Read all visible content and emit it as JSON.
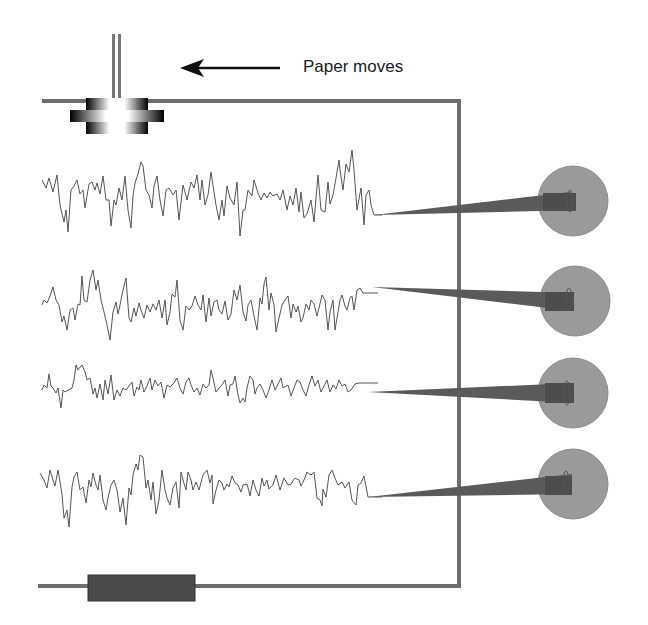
{
  "diagram": {
    "type": "polygraph / chart recorder schematic",
    "label_paper_moves": "Paper moves",
    "arrow_direction": "left",
    "colors": {
      "frame": "#6d6d6d",
      "trace": "#555555",
      "pen_arm": "#5a5a5a",
      "pen_hub": "#9a9a9a",
      "bottom_bar": "#4a4a4a",
      "text": "#1a1a1a"
    },
    "components": [
      {
        "id": "roller",
        "name": "paper feed roller (top-left)"
      },
      {
        "id": "paper-frame",
        "name": "paper path / frame"
      },
      {
        "id": "bottom-bar",
        "name": "paper supply roll (bottom-left)"
      },
      {
        "id": "pen-1",
        "name": "recording pen 1"
      },
      {
        "id": "pen-2",
        "name": "recording pen 2"
      },
      {
        "id": "pen-3",
        "name": "recording pen 3"
      },
      {
        "id": "pen-4",
        "name": "recording pen 4"
      }
    ],
    "traces": [
      {
        "id": "trace-1",
        "baseline_y": 190,
        "pen_y": 203
      },
      {
        "id": "trace-2",
        "baseline_y": 303,
        "pen_y": 293
      },
      {
        "id": "trace-3",
        "baseline_y": 384,
        "pen_y": 393
      },
      {
        "id": "trace-4",
        "baseline_y": 485,
        "pen_y": 485
      }
    ]
  }
}
